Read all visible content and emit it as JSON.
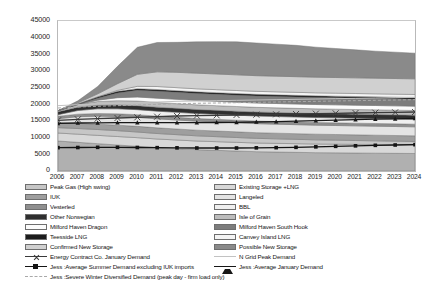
{
  "chart_data": {
    "type": "area",
    "title": "",
    "unit_label": "mmcf/d",
    "xlabel": "",
    "ylabel": "",
    "ylim": [
      0,
      45000
    ],
    "ytick_values": [
      0,
      5000,
      10000,
      15000,
      20000,
      25000,
      30000,
      35000,
      40000,
      45000
    ],
    "ytick_labels": [
      "0",
      "5000",
      "10000",
      "15000",
      "20000",
      "25000",
      "30000",
      "35000",
      "40000",
      "45000"
    ],
    "grid": false,
    "legend_position": "below",
    "x": [
      2006,
      2007,
      2008,
      2009,
      2010,
      2011,
      2012,
      2013,
      2014,
      2015,
      2016,
      2017,
      2018,
      2019,
      2020,
      2021,
      2022,
      2023,
      2024
    ],
    "xtick_labels": [
      "2006",
      "2007",
      "2008",
      "2009",
      "2010",
      "2011",
      "2012",
      "2013",
      "2014",
      "2015",
      "2016",
      "2017",
      "2018",
      "2019",
      "2020",
      "2021",
      "2022",
      "2023",
      "2024"
    ],
    "stack_order_bottom_to_top": [
      "UKCS",
      "Existing Storage +LNG",
      "Peak Gas (High swing)",
      "IUK",
      "Langeled",
      "Vesterled",
      "BBL",
      "Other Norwegian",
      "Isle of Grain",
      "Milford Haven Dragon",
      "Milford Haven South Hook",
      "Teesside LNG",
      "Canvey Island LNG",
      "Confirmed New Storage",
      "Possible New Storage"
    ],
    "series": [
      {
        "name": "UKCS",
        "color": "#b0b0b0",
        "values": [
          9000,
          8600,
          8200,
          7800,
          7400,
          7000,
          6700,
          6400,
          6200,
          6000,
          5800,
          5700,
          5600,
          5500,
          5450,
          5400,
          5350,
          5300,
          5250
        ]
      },
      {
        "name": "Existing Storage +LNG",
        "color": "#d8d8d8",
        "values": [
          2400,
          2450,
          2500,
          2550,
          2600,
          2600,
          2600,
          2600,
          2600,
          2600,
          2600,
          2600,
          2600,
          2600,
          2600,
          2600,
          2600,
          2600,
          2600
        ]
      },
      {
        "name": "Peak Gas (High swing)",
        "color": "#c6c6c6",
        "values": [
          1600,
          1700,
          1750,
          1750,
          1700,
          1650,
          1600,
          1550,
          1500,
          1450,
          1400,
          1350,
          1300,
          1250,
          1200,
          1150,
          1100,
          1050,
          1000
        ]
      },
      {
        "name": "IUK",
        "color": "#9e9e9e",
        "values": [
          1500,
          1550,
          1600,
          1650,
          1700,
          1700,
          1700,
          1700,
          1700,
          1700,
          1700,
          1700,
          1700,
          1700,
          1700,
          1700,
          1700,
          1700,
          1700
        ]
      },
      {
        "name": "Langeled",
        "color": "#e4e4e4",
        "values": [
          1200,
          2000,
          2400,
          2600,
          2700,
          2700,
          2700,
          2700,
          2700,
          2700,
          2700,
          2700,
          2700,
          2700,
          2700,
          2700,
          2700,
          2700,
          2700
        ]
      },
      {
        "name": "Vesterled",
        "color": "#8f8f8f",
        "values": [
          700,
          750,
          800,
          800,
          800,
          800,
          800,
          800,
          800,
          800,
          800,
          800,
          800,
          800,
          800,
          800,
          800,
          800,
          800
        ]
      },
      {
        "name": "BBL",
        "color": "#efefef",
        "values": [
          500,
          1100,
          1400,
          1500,
          1500,
          1500,
          1500,
          1500,
          1500,
          1500,
          1500,
          1500,
          1500,
          1500,
          1500,
          1500,
          1500,
          1500,
          1500
        ]
      },
      {
        "name": "Other Norwegian",
        "color": "#2f2f2f",
        "values": [
          900,
          1000,
          1100,
          1150,
          1200,
          1200,
          1200,
          1200,
          1200,
          1200,
          1200,
          1200,
          1200,
          1200,
          1200,
          1200,
          1200,
          1200,
          1200
        ]
      },
      {
        "name": "Isle of Grain",
        "color": "#bdbdbd",
        "values": [
          300,
          800,
          1100,
          1300,
          1400,
          1400,
          1400,
          1400,
          1400,
          1400,
          1400,
          1400,
          1400,
          1400,
          1400,
          1400,
          1400,
          1400,
          1400
        ]
      },
      {
        "name": "Milford Haven Dragon",
        "color": "#fbfbfb",
        "values": [
          0,
          0,
          400,
          900,
          1200,
          1300,
          1300,
          1300,
          1300,
          1300,
          1300,
          1300,
          1300,
          1300,
          1300,
          1300,
          1300,
          1300,
          1300
        ]
      },
      {
        "name": "Milford Haven South Hook",
        "color": "#7d7d7d",
        "values": [
          0,
          0,
          600,
          1400,
          2000,
          2100,
          2100,
          2100,
          2100,
          2100,
          2100,
          2100,
          2100,
          2100,
          2100,
          2100,
          2100,
          2100,
          2100
        ]
      },
      {
        "name": "Teesside LNG",
        "color": "#1c1c1c",
        "values": [
          0,
          200,
          400,
          500,
          500,
          500,
          500,
          500,
          500,
          500,
          500,
          500,
          500,
          500,
          500,
          500,
          500,
          500,
          500
        ]
      },
      {
        "name": "Canvey Island LNG",
        "color": "#f4f4f4",
        "values": [
          0,
          0,
          0,
          300,
          700,
          900,
          900,
          900,
          900,
          900,
          900,
          900,
          900,
          900,
          900,
          900,
          900,
          900,
          900
        ]
      },
      {
        "name": "Confirmed New Storage",
        "color": "#d0d0d0",
        "values": [
          0,
          300,
          900,
          2000,
          3600,
          4400,
          4600,
          4700,
          4700,
          4700,
          4700,
          4700,
          4700,
          4700,
          4700,
          4700,
          4700,
          4700,
          4700
        ]
      },
      {
        "name": "Possible New Storage",
        "color": "#8a8a8a",
        "values": [
          0,
          600,
          2200,
          5200,
          8100,
          8800,
          9000,
          9400,
          9700,
          9900,
          9800,
          9600,
          9400,
          9000,
          8700,
          8400,
          8100,
          7900,
          7700
        ]
      }
    ],
    "line_series": [
      {
        "name": "Energy Contract Co. January Demand",
        "color": "#3a3a3a",
        "marker": "x",
        "style": "solid",
        "values": [
          15200,
          15500,
          15700,
          15900,
          16100,
          16300,
          16500,
          16600,
          16700,
          16800,
          16900,
          17000,
          17100,
          17200,
          17300,
          17400,
          17500,
          17600,
          17700
        ]
      },
      {
        "name": "Jess :Average Summer Demand excluding IUK imports",
        "color": "#141414",
        "marker": "square",
        "style": "solid",
        "values": [
          7000,
          7050,
          7100,
          7100,
          7050,
          7000,
          6950,
          6900,
          6900,
          6900,
          6950,
          7000,
          7100,
          7250,
          7400,
          7550,
          7700,
          7800,
          7900
        ]
      },
      {
        "name": "Jess :Severe Winter Diversified Demand (peak day - firm load only)",
        "color": "#a9a9a9",
        "marker": "none",
        "style": "dashed",
        "values": [
          18900,
          19200,
          19400,
          19600,
          19800,
          20000,
          20200,
          20300,
          20400,
          20500,
          20600,
          20700,
          20800,
          20900,
          21000,
          21100,
          21200,
          21300,
          21400
        ]
      },
      {
        "name": "N Grid Peak Demand",
        "color": "#c2c2c2",
        "marker": "none",
        "style": "solid",
        "values": [
          19600,
          19900,
          20100,
          20300,
          20500,
          20700,
          20900,
          21000,
          21100,
          21200,
          21300,
          21400,
          21500,
          21600,
          21700,
          21800,
          21900,
          22000,
          22100
        ]
      },
      {
        "name": "Jess :Average January Demand",
        "color": "#171717",
        "marker": "triangle",
        "style": "solid",
        "values": [
          14300,
          14400,
          14450,
          14500,
          14500,
          14500,
          14500,
          14500,
          14550,
          14600,
          14700,
          14800,
          14950,
          15100,
          15250,
          15400,
          15550,
          15650,
          15750
        ]
      }
    ]
  },
  "legend": {
    "column_1": [
      {
        "label": "Peak Gas (High swing)",
        "type": "swatch",
        "color": "#c6c6c6"
      },
      {
        "label": "IUK",
        "type": "swatch",
        "color": "#9e9e9e"
      },
      {
        "label": "Vesterled",
        "type": "swatch",
        "color": "#8f8f8f"
      },
      {
        "label": "Other Norwegian",
        "type": "swatch",
        "color": "#2f2f2f"
      },
      {
        "label": "Milford Haven Dragon",
        "type": "swatch",
        "color": "#fbfbfb"
      },
      {
        "label": "Teesside LNG",
        "type": "swatch",
        "color": "#1c1c1c"
      },
      {
        "label": "Confirmed New Storage",
        "type": "swatch",
        "color": "#d0d0d0"
      },
      {
        "label": "Energy Contract Co. January Demand",
        "type": "line",
        "color": "#3a3a3a",
        "marker": "x",
        "style": "solid"
      },
      {
        "label": "Jess :Average Summer Demand excluding IUK imports",
        "type": "line",
        "color": "#141414",
        "marker": "square",
        "style": "solid"
      },
      {
        "label": "Jess :Severe Winter Diversified Demand (peak day - firm load only)",
        "type": "line",
        "color": "#a9a9a9",
        "marker": "none",
        "style": "dashed"
      }
    ],
    "column_2": [
      {
        "label": "Existing Storage +LNG",
        "type": "swatch",
        "color": "#d8d8d8"
      },
      {
        "label": "Langeled",
        "type": "swatch",
        "color": "#e4e4e4"
      },
      {
        "label": "BBL",
        "type": "swatch",
        "color": "#efefef"
      },
      {
        "label": "Isle of Grain",
        "type": "swatch",
        "color": "#bdbdbd"
      },
      {
        "label": "Milford Haven South Hook",
        "type": "swatch",
        "color": "#7d7d7d"
      },
      {
        "label": "Canvey Island LNG",
        "type": "swatch",
        "color": "#f4f4f4"
      },
      {
        "label": "Possible New Storage",
        "type": "swatch",
        "color": "#8a8a8a"
      },
      {
        "label": "N Grid Peak Demand",
        "type": "line",
        "color": "#c2c2c2",
        "marker": "none",
        "style": "solid"
      },
      {
        "label": "Jess :Average January Demand",
        "type": "line",
        "color": "#171717",
        "marker": "triangle",
        "style": "solid"
      }
    ]
  }
}
